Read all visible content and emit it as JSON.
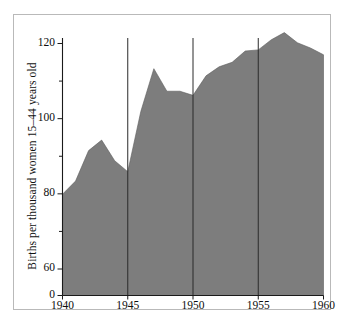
{
  "chart_data": {
    "type": "area",
    "title": "",
    "subtitle": "",
    "xlabel": "",
    "ylabel": "Births per thousand women 15–44 years old",
    "x": [
      1940,
      1941,
      1942,
      1943,
      1944,
      1945,
      1946,
      1947,
      1948,
      1949,
      1950,
      1951,
      1952,
      1953,
      1954,
      1955,
      1956,
      1957,
      1958,
      1959,
      1960
    ],
    "values": [
      79.9,
      83.4,
      91.5,
      94.3,
      88.8,
      85.9,
      101.9,
      113.3,
      107.3,
      107.3,
      106.2,
      111.4,
      113.8,
      115.0,
      118.0,
      118.3,
      121.0,
      122.9,
      120.2,
      118.8,
      117.0
    ],
    "series": [
      {
        "name": "Birth rate",
        "values": [
          79.9,
          83.4,
          91.5,
          94.3,
          88.8,
          85.9,
          101.9,
          113.3,
          107.3,
          107.3,
          106.2,
          111.4,
          113.8,
          115.0,
          118.0,
          118.3,
          121.0,
          122.9,
          120.2,
          118.8,
          117.0
        ],
        "fill_color": "#7d7d7d"
      }
    ],
    "xlim": [
      1940,
      1960
    ],
    "ylim": [
      55,
      128
    ],
    "y_axis_broken": true,
    "y_break_from": 0,
    "y_break_to": 55,
    "yticks_major": [
      0,
      60,
      80,
      100,
      120
    ],
    "yticks_minor": [
      70,
      90,
      110
    ],
    "xticks": [
      1940,
      1945,
      1950,
      1955,
      1960
    ],
    "grid": "vertical-only",
    "gridlines_x": [
      1945,
      1950,
      1955
    ],
    "legend": null,
    "legend_position": "none",
    "annotations": []
  },
  "axes": {
    "y_label_text": "Births per thousand women 15–44 years old",
    "y_tick_labels": [
      "120",
      "100",
      "80",
      "60",
      "0"
    ],
    "x_tick_labels": [
      "1940",
      "1945",
      "1950",
      "1955",
      "1960"
    ]
  },
  "style": {
    "fill": "#7d7d7d",
    "axis": "#1a1a1a",
    "background": "#ffffff",
    "frame": "#b9b9b9"
  }
}
